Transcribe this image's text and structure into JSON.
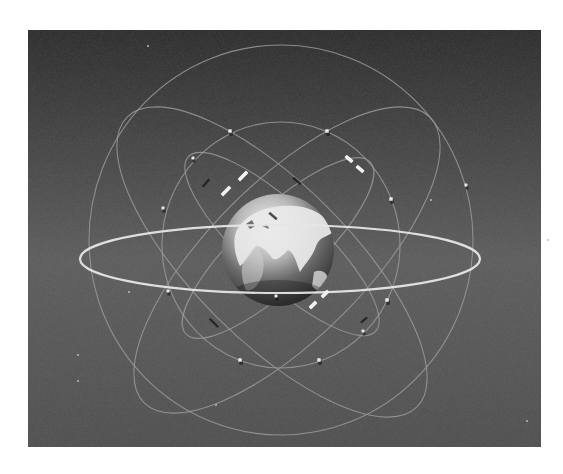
{
  "figure": {
    "canvas": {
      "width": 563,
      "height": 474,
      "page_bg": "#ffffff"
    },
    "panel": {
      "x": 28,
      "y": 30,
      "width": 513,
      "height": 417,
      "bg_top": "#262626",
      "bg_mid": "#585858",
      "bg_bottom": "#4a4a4a"
    },
    "colors": {
      "orbit": "#9a9a9a",
      "orbit_bright": "#e6e6e6",
      "satellite": "#e8e8e8",
      "panel_solar": "#f2f2f2",
      "globe_light": "#f4f4f4",
      "globe_dark": "#1e1e1e",
      "globe_mid": "#6a6a6a"
    },
    "earth": {
      "cx": 278,
      "cy": 250,
      "r": 56
    },
    "orbits": [
      {
        "id": "outer-polar",
        "cx": 281,
        "cy": 240,
        "rx": 192,
        "ry": 195,
        "rotate": 0,
        "style": "dim"
      },
      {
        "id": "middle-ring",
        "cx": 281,
        "cy": 245,
        "rx": 119,
        "ry": 123,
        "rotate": 0,
        "style": "dim"
      },
      {
        "id": "tilted-large-a",
        "cx": 272,
        "cy": 262,
        "rx": 205,
        "ry": 78,
        "rotate": 45,
        "style": "dim"
      },
      {
        "id": "tilted-large-b",
        "cx": 287,
        "cy": 260,
        "rx": 202,
        "ry": 78,
        "rotate": -45,
        "style": "dim"
      },
      {
        "id": "tilted-inner-a",
        "cx": 282,
        "cy": 244,
        "rx": 128,
        "ry": 38,
        "rotate": 43,
        "style": "dim"
      },
      {
        "id": "tilted-inner-b",
        "cx": 278,
        "cy": 248,
        "rx": 126,
        "ry": 38,
        "rotate": -43,
        "style": "dim"
      },
      {
        "id": "equatorial",
        "cx": 280,
        "cy": 259,
        "rx": 200,
        "ry": 34,
        "rotate": 0,
        "style": "bright"
      }
    ],
    "satellites": [
      {
        "x": 230,
        "y": 131,
        "size": 3.5
      },
      {
        "x": 327,
        "y": 131,
        "size": 3.5
      },
      {
        "x": 193,
        "y": 158,
        "size": 3
      },
      {
        "x": 163,
        "y": 208,
        "size": 3
      },
      {
        "x": 391,
        "y": 199,
        "size": 3.5
      },
      {
        "x": 466,
        "y": 185,
        "size": 3
      },
      {
        "x": 168,
        "y": 291,
        "size": 3
      },
      {
        "x": 276,
        "y": 296,
        "size": 3
      },
      {
        "x": 387,
        "y": 300,
        "size": 3.5
      },
      {
        "x": 363,
        "y": 331,
        "size": 3
      },
      {
        "x": 240,
        "y": 360,
        "size": 3.5
      },
      {
        "x": 319,
        "y": 360,
        "size": 3.5
      }
    ],
    "solar_panels": [
      {
        "x": 243,
        "y": 176,
        "len": 12,
        "rotate": -45
      },
      {
        "x": 226,
        "y": 191,
        "len": 12,
        "rotate": -45
      },
      {
        "x": 349,
        "y": 159,
        "len": 9,
        "rotate": 40
      },
      {
        "x": 360,
        "y": 169,
        "len": 9,
        "rotate": 40
      },
      {
        "x": 325,
        "y": 294,
        "len": 9,
        "rotate": -45
      },
      {
        "x": 313,
        "y": 305,
        "len": 9,
        "rotate": -45
      }
    ],
    "shadows": [
      {
        "x": 206,
        "y": 183,
        "len": 10,
        "rotate": -50
      },
      {
        "x": 297,
        "y": 181,
        "len": 10,
        "rotate": 40
      },
      {
        "x": 214,
        "y": 323,
        "len": 12,
        "rotate": 45
      },
      {
        "x": 273,
        "y": 216,
        "len": 10,
        "rotate": 40
      },
      {
        "x": 364,
        "y": 320,
        "len": 8,
        "rotate": -40
      }
    ],
    "stars": [
      {
        "x": 148,
        "y": 46
      },
      {
        "x": 431,
        "y": 200
      },
      {
        "x": 78,
        "y": 355
      },
      {
        "x": 78,
        "y": 381
      },
      {
        "x": 216,
        "y": 405
      },
      {
        "x": 527,
        "y": 421
      },
      {
        "x": 548,
        "y": 240
      },
      {
        "x": 129,
        "y": 292
      }
    ]
  }
}
